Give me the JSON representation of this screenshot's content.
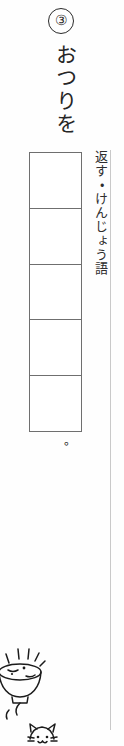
{
  "worksheet": {
    "question_number": "③",
    "prompt_text": "おつりを",
    "annotation_text": "返す・けんじょう語",
    "period_mark": "。",
    "answer_grid": {
      "cell_count": 5,
      "cells": [
        "",
        "",
        "",
        "",
        ""
      ]
    },
    "illustration": {
      "label": "cat-and-bowl-doodle",
      "parts": [
        "sparkle-lines",
        "rice-bowl",
        "cat-face"
      ]
    },
    "colors": {
      "page_background": "#fefefe",
      "ink": "#1b1b1b",
      "grid_line": "#6f6f6f",
      "margin_rule": "#c9c9c9"
    }
  }
}
